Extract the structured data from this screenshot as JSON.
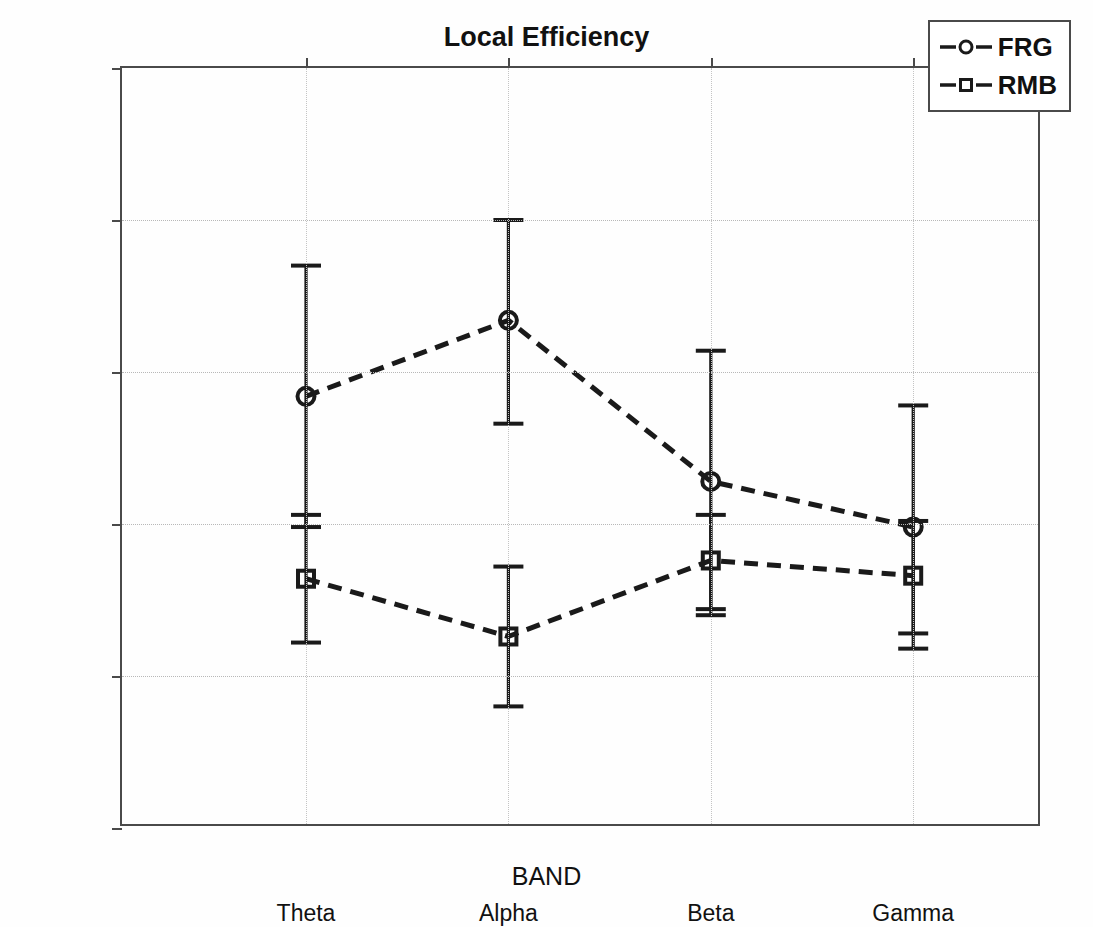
{
  "figure": {
    "ghost_top_text": "",
    "title": "Local Efficiency",
    "xlabel": "BAND",
    "ylabel_main": "E",
    "ylabel_sub1": "l",
    "ylabel_mid": " / E",
    "ylabel_sub2": "l",
    "ylabel_tail": "-r"
  },
  "legend": {
    "position": "top-right",
    "entries": [
      {
        "label": "FRG",
        "marker": "circle",
        "linestyle": "dashed",
        "color": "#1a1a1a"
      },
      {
        "label": "RMB",
        "marker": "square",
        "linestyle": "dashed",
        "color": "#1a1a1a"
      }
    ]
  },
  "axes": {
    "y_ticklabels": [
      "3",
      "2.5",
      "2",
      "1.5",
      "1",
      "0.5"
    ],
    "y_tickvalues": [
      3,
      2.5,
      2,
      1.5,
      1,
      0.5
    ],
    "x_ticklabels": [
      "Theta",
      "Alpha",
      "Beta",
      "Gamma"
    ]
  },
  "chart_data": {
    "type": "line",
    "title": "Local Efficiency",
    "xlabel": "BAND",
    "ylabel": "E_l / E_l-r",
    "categories": [
      "Theta",
      "Alpha",
      "Beta",
      "Gamma"
    ],
    "ylim": [
      0.5,
      3
    ],
    "xlim": [
      0,
      5
    ],
    "x_positions": [
      1,
      2.1,
      3.2,
      4.3
    ],
    "grid": true,
    "legend_position": "top-right",
    "series": [
      {
        "name": "FRG",
        "marker": "circle",
        "linestyle": "dashed",
        "values": [
          1.92,
          2.17,
          1.64,
          1.49
        ],
        "err_upper": [
          2.35,
          2.5,
          2.07,
          1.89
        ],
        "err_lower": [
          1.49,
          1.83,
          1.22,
          1.09
        ]
      },
      {
        "name": "RMB",
        "marker": "square",
        "linestyle": "dashed",
        "values": [
          1.32,
          1.13,
          1.38,
          1.33
        ],
        "err_upper": [
          1.53,
          1.36,
          1.53,
          1.51
        ],
        "err_lower": [
          1.11,
          0.9,
          1.2,
          1.14
        ]
      }
    ]
  }
}
